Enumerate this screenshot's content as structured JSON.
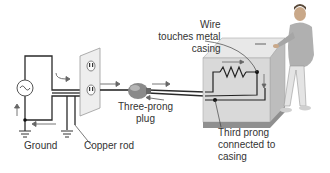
{
  "diagram": {
    "type": "grounded-appliance-circuit",
    "labels": {
      "wire": [
        "Wire",
        "touches metal",
        "casing"
      ],
      "plug": [
        "Three-prong",
        "plug"
      ],
      "ground": "Ground",
      "copper_rod": "Copper rod",
      "third_prong": [
        "Third prong",
        "connected to",
        "casing"
      ]
    },
    "components": [
      "ac-source",
      "wall-outlet",
      "three-prong-plug",
      "appliance-casing",
      "heating-element",
      "ground-symbol",
      "copper-rod-ground",
      "person"
    ],
    "colors": {
      "wire": "#2a2a2a",
      "arrow": "#555555",
      "casing_front": "#d9d9d9",
      "casing_top": "#e8e8e8",
      "casing_side": "#bdbdbd",
      "plug": "#8a8a8a",
      "outlet": "#eeeeee",
      "person_shirt": "#b0b0b0",
      "person_skin": "#c9a889"
    }
  }
}
